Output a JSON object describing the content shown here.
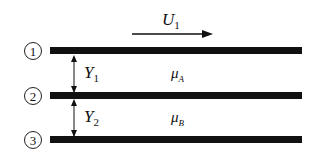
{
  "diagram": {
    "velocity": {
      "symbol": "U",
      "subscript": "1"
    },
    "plates": [
      {
        "number": "①"
      },
      {
        "number": "②"
      },
      {
        "number": "③"
      }
    ],
    "gaps": [
      {
        "symbol": "Y",
        "subscript": "1",
        "viscosity": "μ",
        "viscosity_sub": "A"
      },
      {
        "symbol": "Y",
        "subscript": "2",
        "viscosity": "μ",
        "viscosity_sub": "B"
      }
    ]
  }
}
